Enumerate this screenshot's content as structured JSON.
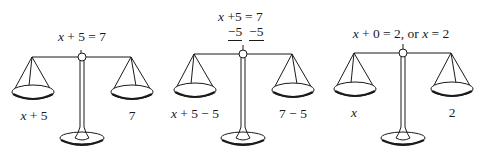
{
  "diagram": {
    "colors": {
      "ink": "#1a1a1a",
      "background": "#ffffff"
    },
    "panels": [
      {
        "equation": {
          "lhs_var": "x",
          "lhs_rest": " + 5 = 7"
        },
        "left_pan": {
          "var": "x",
          "rest": " + 5"
        },
        "right_pan": "7"
      },
      {
        "equation": {
          "lhs_var": "x",
          "line1_rest": " +5 = 7",
          "line2_left": "−5",
          "line2_right": "−5"
        },
        "left_pan": {
          "var": "x",
          "rest": " + 5 − 5"
        },
        "right_pan": "7 − 5"
      },
      {
        "equation": {
          "part1_var": "x",
          "part1_rest": " + 0 = 2, or ",
          "part2_var": "x",
          "part2_rest": " = 2"
        },
        "left_pan": {
          "var": "x",
          "rest": ""
        },
        "right_pan": "2"
      }
    ]
  }
}
